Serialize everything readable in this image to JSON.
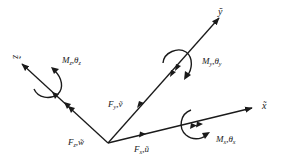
{
  "diagram": {
    "type": "3d-coordinate-frame-forces-moments",
    "colors": {
      "stroke": "#1a1a1a",
      "background": "#ffffff"
    },
    "origin": {
      "x": 108,
      "y": 143
    },
    "axes": [
      {
        "id": "x",
        "label": "x̃",
        "end": {
          "x": 252,
          "y": 108
        }
      },
      {
        "id": "y",
        "label": "ỹ",
        "end": {
          "x": 219,
          "y": 18
        }
      },
      {
        "id": "z",
        "label": "z̃",
        "end": {
          "x": 22,
          "y": 64
        }
      }
    ],
    "forces": [
      {
        "axis": "x",
        "symbol": "F",
        "sub": "x",
        "disp": "ũ"
      },
      {
        "axis": "y",
        "symbol": "F",
        "sub": "y",
        "disp": "ṽ"
      },
      {
        "axis": "z",
        "symbol": "F",
        "sub": "z",
        "disp": "w̃"
      }
    ],
    "moments": [
      {
        "axis": "x",
        "symbol": "M",
        "sub": "x",
        "angle": "θ",
        "angle_sub": "x"
      },
      {
        "axis": "y",
        "symbol": "M",
        "sub": "y",
        "angle": "θ",
        "angle_sub": "y"
      },
      {
        "axis": "z",
        "symbol": "M",
        "sub": "z",
        "angle": "θ",
        "angle_sub": "z"
      }
    ]
  }
}
